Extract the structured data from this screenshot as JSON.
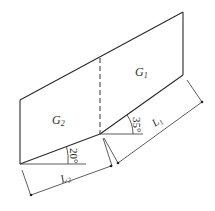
{
  "diagram": {
    "type": "geometry-figure",
    "regions": [
      {
        "id": "G1",
        "label": "G",
        "subscript": "1"
      },
      {
        "id": "G2",
        "label": "G",
        "subscript": "2"
      }
    ],
    "angles": [
      {
        "id": "angle-35",
        "value": "35°"
      },
      {
        "id": "angle-20",
        "value": "20°"
      }
    ],
    "dimensions": [
      {
        "id": "L1",
        "label": "L",
        "subscript": "1"
      },
      {
        "id": "L2",
        "label": "L",
        "subscript": "2"
      }
    ],
    "colors": {
      "stroke": "#2a2a2a",
      "background": "#ffffff"
    }
  }
}
